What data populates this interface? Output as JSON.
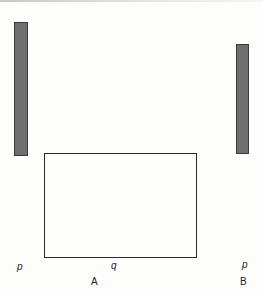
{
  "diagram": {
    "left_bar": {
      "label": "p",
      "color": "#6e6e6e"
    },
    "right_bar": {
      "label": "p",
      "color": "#6e6e6e"
    },
    "rectangle": {
      "label": "q"
    },
    "figure_labels": {
      "A": "A",
      "B": "B"
    }
  }
}
